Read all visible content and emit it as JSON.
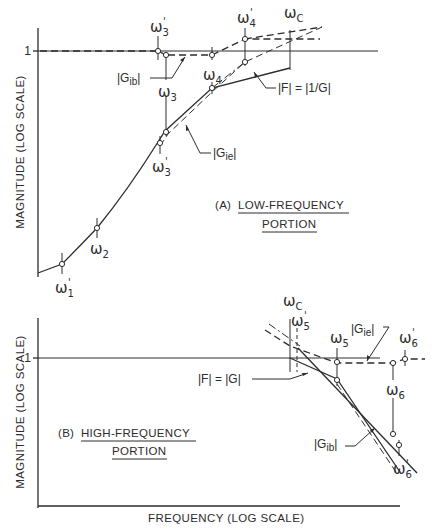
{
  "figure": {
    "panel_a": {
      "caption_prefix": "(A)",
      "caption_line1": "LOW-FREQUENCY",
      "caption_line2": "PORTION",
      "y_axis_label": "MAGNITUDE (LOG SCALE)",
      "unity_tick": "1",
      "labels": {
        "w1p": {
          "base": "ω",
          "sub": "1",
          "prime": "'"
        },
        "w2": {
          "base": "ω",
          "sub": "2",
          "prime": ""
        },
        "w3p_top": {
          "base": "ω",
          "sub": "3",
          "prime": "'"
        },
        "w3": {
          "base": "ω",
          "sub": "3",
          "prime": ""
        },
        "w3p_low": {
          "base": "ω",
          "sub": "3",
          "prime": "'"
        },
        "w4": {
          "base": "ω",
          "sub": "4",
          "prime": ""
        },
        "w4p": {
          "base": "ω",
          "sub": "4",
          "prime": "'"
        },
        "wc": {
          "base": "ω",
          "sub": "C",
          "prime": ""
        }
      },
      "curve_labels": {
        "gib": {
          "pre": "|G",
          "sub": "ib",
          "post": "|"
        },
        "gie": {
          "pre": "|G",
          "sub": "ie",
          "post": "|"
        },
        "f": "|F| = |1/G|"
      }
    },
    "panel_b": {
      "caption_prefix": "(B)",
      "caption_line1": "HIGH-FREQUENCY",
      "caption_line2": "PORTION",
      "y_axis_label": "MAGNITUDE (LOG SCALE)",
      "x_axis_label": "FREQUENCY (LOG SCALE)",
      "unity_tick": "1",
      "labels": {
        "wc": {
          "base": "ω",
          "sub": "C",
          "prime": ""
        },
        "w5p": {
          "base": "ω",
          "sub": "5",
          "prime": "'"
        },
        "w5": {
          "base": "ω",
          "sub": "5",
          "prime": ""
        },
        "w6p_top": {
          "base": "ω",
          "sub": "6",
          "prime": "'"
        },
        "w6": {
          "base": "ω",
          "sub": "6",
          "prime": ""
        },
        "w6p_low": {
          "base": "ω",
          "sub": "6",
          "prime": "'"
        }
      },
      "curve_labels": {
        "gie": {
          "pre": "|G",
          "sub": "ie",
          "post": "|"
        },
        "gib": {
          "pre": "|G",
          "sub": "ib",
          "post": "|"
        },
        "f": "|F| = |G|"
      }
    },
    "line_color": "#2c2c2c",
    "background": "#ffffff"
  }
}
